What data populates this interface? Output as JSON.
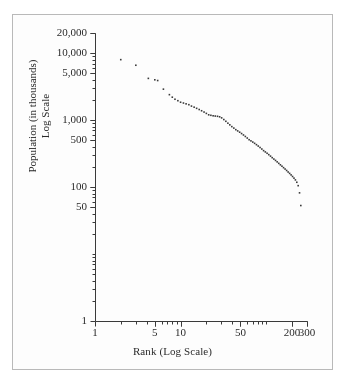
{
  "figure": {
    "background": "#fdfdfd",
    "border_color": "#b9b9b9",
    "ink_color": "#3a3a3a",
    "text_color": "#2b2b2b"
  },
  "chart_data": {
    "type": "scatter",
    "title": "",
    "xlabel": "Rank (Log Scale)",
    "ylabel_line1": "Population (in thousands)",
    "ylabel_line2": "Log Scale",
    "xscale": "log",
    "yscale": "log",
    "xlim": [
      1,
      300
    ],
    "ylim": [
      1,
      20000
    ],
    "grid": false,
    "legend": null,
    "marker": "dot",
    "marker_size_px": 1.6,
    "xticklabels": [
      "1",
      "5",
      "10",
      "50",
      "200",
      "300"
    ],
    "xtickvalues": [
      1,
      5,
      10,
      50,
      200,
      300
    ],
    "xminorticks": [
      2,
      3,
      4,
      5,
      6,
      7,
      8,
      9,
      10,
      20,
      30,
      40,
      50,
      60,
      70,
      80,
      90,
      100,
      200,
      300
    ],
    "yticklabels": [
      "1",
      "50",
      "100",
      "500",
      "1,000",
      "5,000",
      "10,000",
      "20,000"
    ],
    "ytickvalues": [
      1,
      50,
      100,
      500,
      1000,
      5000,
      10000,
      20000
    ],
    "yminorticks": [
      2,
      3,
      4,
      5,
      6,
      7,
      8,
      9,
      10,
      20,
      30,
      40,
      50,
      60,
      70,
      80,
      90,
      100,
      200,
      300,
      400,
      500,
      600,
      700,
      800,
      900,
      1000,
      2000,
      3000,
      4000,
      5000,
      6000,
      7000,
      8000,
      9000,
      10000,
      20000
    ],
    "x": [
      2,
      3,
      4.2,
      5,
      5.4,
      6.3,
      7.4,
      8.0,
      8.6,
      9.3,
      10,
      10.8,
      11.6,
      12.5,
      13.4,
      14.4,
      15.4,
      16.5,
      17.6,
      18.8,
      20,
      21.3,
      22.6,
      24,
      25.4,
      27,
      28.6,
      30.2,
      32,
      33.8,
      35.7,
      37.6,
      39.7,
      41.9,
      44.2,
      46.5,
      49,
      51.6,
      54.3,
      57.1,
      60.1,
      63.2,
      66.4,
      69.8,
      73.3,
      77,
      80.8,
      84.8,
      89,
      93.3,
      97.8,
      102.5,
      107.3,
      112.4,
      117.6,
      123,
      128.6,
      134.4,
      140.4,
      146.6,
      153,
      159.6,
      166.4,
      173.4,
      180.6,
      188,
      195.6,
      203.4,
      211.4,
      219.6,
      228,
      236.6,
      245.4,
      254
    ],
    "y": [
      8000,
      6600,
      4200,
      4000,
      3900,
      2900,
      2400,
      2200,
      2050,
      1950,
      1850,
      1800,
      1750,
      1700,
      1620,
      1560,
      1500,
      1440,
      1380,
      1320,
      1260,
      1200,
      1180,
      1160,
      1150,
      1140,
      1120,
      1080,
      1020,
      960,
      900,
      850,
      800,
      760,
      720,
      690,
      660,
      630,
      600,
      570,
      540,
      510,
      490,
      470,
      450,
      430,
      410,
      390,
      370,
      350,
      335,
      320,
      305,
      290,
      275,
      262,
      250,
      238,
      226,
      215,
      205,
      195,
      186,
      177,
      168,
      160,
      152,
      144,
      136,
      128,
      118,
      105,
      82,
      53
    ]
  }
}
